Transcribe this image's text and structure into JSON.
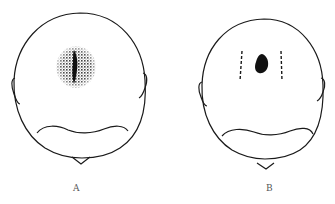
{
  "figure": {
    "panels": [
      {
        "id": "A",
        "label": "A",
        "lesion": "diffuse-stippled-patch-with-central-dark-streak"
      },
      {
        "id": "B",
        "label": "B",
        "lesion": "solid-dark-spot-with-dashed-margins"
      }
    ],
    "colors": {
      "line": "#1a1a1a",
      "fill": "#111111",
      "background": "#ffffff"
    }
  }
}
